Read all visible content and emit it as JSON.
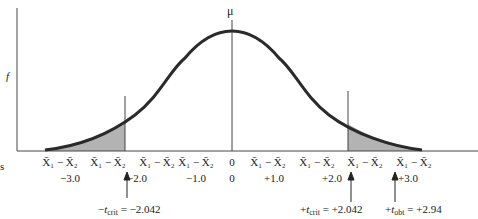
{
  "diagram": {
    "y_axis_label": "f",
    "mean_label": "μ",
    "cut_label": "s",
    "x_labels": [
      {
        "var": "X̄₁ − X̄₂",
        "value": "−3.0"
      },
      {
        "var": "X̄₁ − X̄₂",
        "value": "−2.0"
      },
      {
        "var": "X̄₁ − X̄₂",
        "value": "−1.0"
      },
      {
        "var": "0",
        "value": "0"
      },
      {
        "var": "X̄₁ − X̄₂",
        "value": "+1.0"
      },
      {
        "var": "X̄₁ − X̄₂",
        "value": "+2.0"
      },
      {
        "var": "X̄₁ − X̄₂",
        "value": "+3.0"
      }
    ],
    "annotations": {
      "neg_tcrit": {
        "sign": "−",
        "t": "t",
        "sub": "crit",
        "value": " = −2.042"
      },
      "pos_tcrit": {
        "sign": "+",
        "t": "t",
        "sub": "crit",
        "value": " = +2.042"
      },
      "pos_tobt": {
        "sign": "+",
        "t": "t",
        "sub": "obt",
        "value": " = +2.94"
      }
    },
    "colors": {
      "curve": "#2a2a2a",
      "shade": "#b3b3b3",
      "axis": "#444444"
    }
  }
}
